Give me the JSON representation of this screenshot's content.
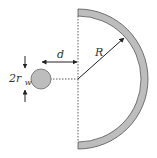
{
  "diagram": {
    "labels": {
      "distance": "d",
      "radius": "R",
      "diameter_coeff": "2r",
      "diameter_sub": "w"
    },
    "colors": {
      "shell_fill": "#bdbdbd",
      "shell_stroke": "#555555",
      "well_fill": "#bdbdbd",
      "line": "#222222"
    }
  }
}
